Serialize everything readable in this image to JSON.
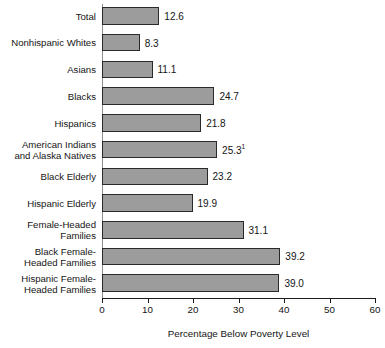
{
  "chart_data": {
    "type": "bar",
    "orientation": "horizontal",
    "title": "",
    "xlabel": "Percentage Below Poverty Level",
    "ylabel": "",
    "xlim": [
      0,
      60
    ],
    "xticks": [
      0,
      10,
      20,
      30,
      40,
      50,
      60
    ],
    "xtick_labels": [
      "0",
      "10",
      "20",
      "30",
      "40",
      "50",
      "60"
    ],
    "grid": false,
    "legend": null,
    "bar_color": "#9c9c9c",
    "bar_border_color": "#2a2a2a",
    "categories": [
      "Total",
      "Nonhispanic Whites",
      "Asians",
      "Blacks",
      "Hispanics",
      "American Indians and Alaska Natives",
      "Black Elderly",
      "Hispanic Elderly",
      "Female-Headed Families",
      "Black Female-Headed Families",
      "Hispanic Female-Headed Families"
    ],
    "values": [
      12.6,
      8.3,
      11.1,
      24.7,
      21.8,
      25.3,
      23.2,
      19.9,
      31.1,
      39.2,
      39.0
    ],
    "value_labels": [
      "12.6",
      "8.3",
      "11.1",
      "24.7",
      "21.8",
      "25.3",
      "23.2",
      "19.9",
      "31.1",
      "39.2",
      "39.0"
    ],
    "footnote_markers": [
      "",
      "",
      "",
      "",
      "",
      "1",
      "",
      "",
      "",
      "",
      ""
    ]
  },
  "rows": [
    {
      "label_lines": [
        "Total"
      ],
      "value": 12.6,
      "value_label": "12.6",
      "footnote": ""
    },
    {
      "label_lines": [
        "Nonhispanic Whites"
      ],
      "value": 8.3,
      "value_label": "8.3",
      "footnote": ""
    },
    {
      "label_lines": [
        "Asians"
      ],
      "value": 11.1,
      "value_label": "11.1",
      "footnote": ""
    },
    {
      "label_lines": [
        "Blacks"
      ],
      "value": 24.7,
      "value_label": "24.7",
      "footnote": ""
    },
    {
      "label_lines": [
        "Hispanics"
      ],
      "value": 21.8,
      "value_label": "21.8",
      "footnote": ""
    },
    {
      "label_lines": [
        "American Indians",
        "and Alaska Natives"
      ],
      "value": 25.3,
      "value_label": "25.3",
      "footnote": "1"
    },
    {
      "label_lines": [
        "Black Elderly"
      ],
      "value": 23.2,
      "value_label": "23.2",
      "footnote": ""
    },
    {
      "label_lines": [
        "Hispanic Elderly"
      ],
      "value": 19.9,
      "value_label": "19.9",
      "footnote": ""
    },
    {
      "label_lines": [
        "Female-Headed",
        "Families"
      ],
      "value": 31.1,
      "value_label": "31.1",
      "footnote": ""
    },
    {
      "label_lines": [
        "Black Female-",
        "Headed Families"
      ],
      "value": 39.2,
      "value_label": "39.2",
      "footnote": ""
    },
    {
      "label_lines": [
        "Hispanic Female-",
        "Headed Families"
      ],
      "value": 39.0,
      "value_label": "39.0",
      "footnote": ""
    }
  ]
}
